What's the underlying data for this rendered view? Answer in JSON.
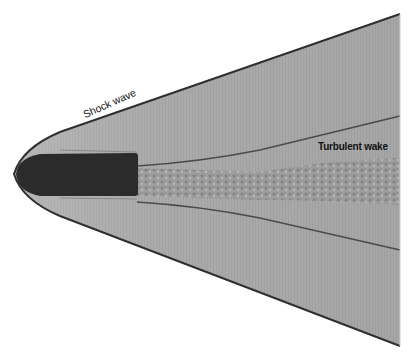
{
  "photo": {
    "subject": "Schlieren photograph of a supersonic bullet",
    "colors": {
      "background": "#ffffff",
      "flow_field": "#a8a8a8",
      "bullet": "#2a2a2a",
      "shock_line": "#3a3a3a",
      "wake": "#8c8c8c"
    }
  },
  "labels": {
    "shock_wave": "Shock wave",
    "turbulent_wake": "Turbulent wake"
  }
}
